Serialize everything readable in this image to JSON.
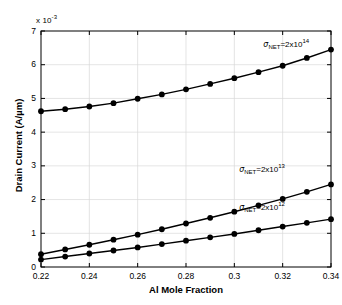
{
  "chart_data": {
    "type": "line",
    "title": "",
    "xlabel": "Al Mole Fraction",
    "ylabel": "Drain Current (A/µm)",
    "y_multiplier": "x 10",
    "y_multiplier_exponent": "-3",
    "xlim": [
      0.22,
      0.34
    ],
    "ylim": [
      0,
      7
    ],
    "xticks": [
      0.22,
      0.24,
      0.26,
      0.28,
      0.3,
      0.32,
      0.34
    ],
    "xtick_labels": [
      "0.22",
      "0.24",
      "0.26",
      "0.28",
      "0.3",
      "0.32",
      "0.34"
    ],
    "yticks": [
      0,
      1,
      2,
      3,
      4,
      5,
      6,
      7
    ],
    "ytick_labels": [
      "0",
      "1",
      "2",
      "3",
      "4",
      "5",
      "6",
      "7"
    ],
    "grid": true,
    "legend_position": "inline-annotations",
    "marker": "filled-circle",
    "line_color": "#000000",
    "grid_color": "#d9d9d9",
    "x": [
      0.22,
      0.23,
      0.24,
      0.25,
      0.26,
      0.27,
      0.28,
      0.29,
      0.3,
      0.31,
      0.32,
      0.33,
      0.34
    ],
    "series": [
      {
        "name": "sigma_NET=2x10^14",
        "label_base": "=2x10",
        "label_symbol": "σ",
        "label_subscript": "NET",
        "label_exponent": "14",
        "values": [
          4.62,
          4.68,
          4.76,
          4.86,
          4.99,
          5.12,
          5.27,
          5.43,
          5.6,
          5.78,
          5.97,
          6.2,
          6.45
        ]
      },
      {
        "name": "sigma_NET=2x10^13",
        "label_base": "=2x10",
        "label_symbol": "σ",
        "label_subscript": "NET",
        "label_exponent": "13",
        "values": [
          0.38,
          0.52,
          0.66,
          0.81,
          0.96,
          1.12,
          1.29,
          1.46,
          1.64,
          1.83,
          2.02,
          2.23,
          2.45
        ]
      },
      {
        "name": "sigma_NET=2x10^12",
        "label_base": "=2x10",
        "label_symbol": "σ",
        "label_subscript": "NET",
        "label_exponent": "12",
        "values": [
          0.22,
          0.31,
          0.4,
          0.49,
          0.58,
          0.68,
          0.78,
          0.88,
          0.98,
          1.09,
          1.2,
          1.31,
          1.42
        ]
      }
    ],
    "annotations": [
      {
        "series_index": 0,
        "x": 0.312,
        "y": 6.62
      },
      {
        "series_index": 1,
        "x": 0.302,
        "y": 2.9
      },
      {
        "series_index": 2,
        "x": 0.302,
        "y": 1.78
      }
    ]
  }
}
